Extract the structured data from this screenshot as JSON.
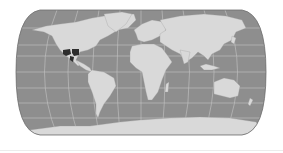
{
  "map": {
    "projection": "pseudo-cylindrical (Robinson-like)",
    "colors": {
      "background": "#ffffff",
      "ocean": "#8e8e8e",
      "land": "#d9d9d9",
      "graticule": "#c6c6c6",
      "outline": "#6e6e6e",
      "highlight": "#2e2e2e"
    },
    "highlighted_regions": [
      {
        "name": "northern-mexico",
        "description": "dark shaded states in northern Mexico"
      }
    ]
  }
}
